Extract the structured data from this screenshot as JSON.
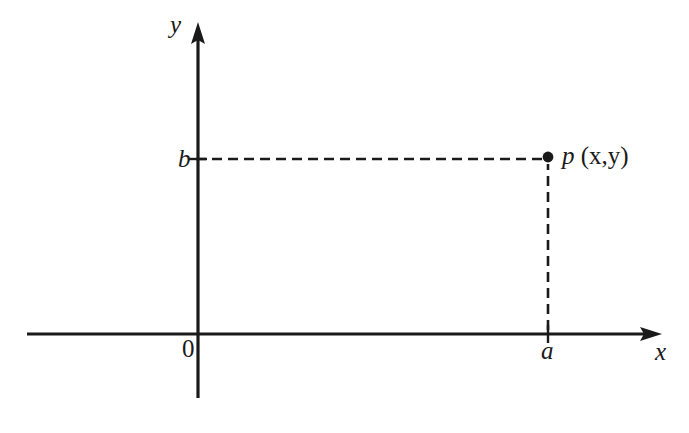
{
  "figure": {
    "background_color": "#ffffff",
    "ink_color": "#1a1a1a",
    "width": 689,
    "height": 433
  },
  "axes": {
    "y_axis": {
      "label": "y",
      "x_position": 198,
      "top": 22,
      "bottom": 398,
      "arrow": "up"
    },
    "x_axis": {
      "label": "x",
      "y_position": 334,
      "left": 27,
      "right": 662,
      "arrow": "right"
    },
    "origin": {
      "label": "0",
      "x": 198,
      "y": 334
    }
  },
  "point": {
    "label_p": "p",
    "label_coords": "(x,y)",
    "label_full": "p (x,y)",
    "x": 548,
    "y": 157,
    "dot_radius": 5
  },
  "ticks": {
    "x_tick": {
      "label": "a",
      "x": 548,
      "y": 334
    },
    "y_tick": {
      "label": "b",
      "x": 198,
      "y": 159
    }
  },
  "guides": {
    "horizontal": {
      "name": "b-to-point-dashed-line",
      "from_x": 190,
      "to_x": 544,
      "y": 159,
      "style": "dashed"
    },
    "vertical": {
      "name": "a-to-point-dashed-line",
      "x": 548,
      "from_y": 326,
      "to_y": 163,
      "style": "dashed"
    },
    "dash_pattern": "10 6"
  }
}
